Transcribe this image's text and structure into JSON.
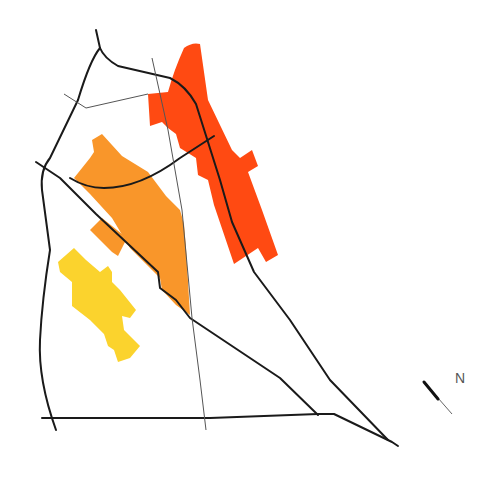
{
  "map": {
    "colors": {
      "zone_red": "#ff4a12",
      "zone_orange": "#f9962a",
      "zone_yellow": "#fbd32d",
      "road": "#1a1a1a",
      "minor_road": "#555555"
    },
    "zones": [
      {
        "name": "red-zone",
        "color": "#ff4a12"
      },
      {
        "name": "orange-zone",
        "color": "#f9962a"
      },
      {
        "name": "yellow-zone",
        "color": "#fbd32d"
      }
    ]
  },
  "compass": {
    "label": "N",
    "icon": "north-arrow-icon"
  }
}
